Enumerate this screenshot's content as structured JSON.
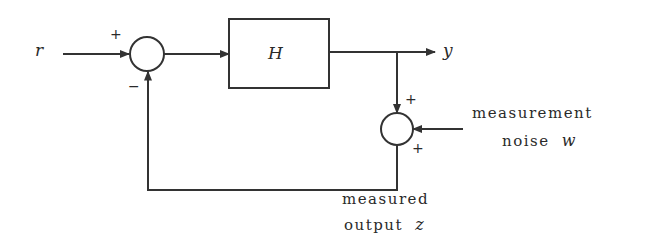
{
  "diagram": {
    "type": "feedback-block-diagram",
    "colors": {
      "stroke": "#333333",
      "background": "#ffffff"
    },
    "nodes": {
      "input": {
        "label": "r"
      },
      "summing_junction_1": {
        "signs": {
          "input": "+",
          "feedback": "−"
        }
      },
      "block": {
        "label": "H"
      },
      "output": {
        "label": "y"
      },
      "summing_junction_2": {
        "signs": {
          "from_output": "+",
          "noise": "+"
        }
      },
      "noise": {
        "line1": "measurement",
        "line2": "noise",
        "symbol": "w"
      },
      "measured_output": {
        "line1": "measured",
        "line2": "output",
        "symbol": "z"
      }
    },
    "edges": [
      {
        "from": "input",
        "to": "summing_junction_1"
      },
      {
        "from": "summing_junction_1",
        "to": "block"
      },
      {
        "from": "block",
        "to": "output"
      },
      {
        "from": "output",
        "to": "summing_junction_2"
      },
      {
        "from": "noise",
        "to": "summing_junction_2"
      },
      {
        "from": "summing_junction_2",
        "to": "summing_junction_1",
        "label": "measured output z"
      }
    ]
  }
}
